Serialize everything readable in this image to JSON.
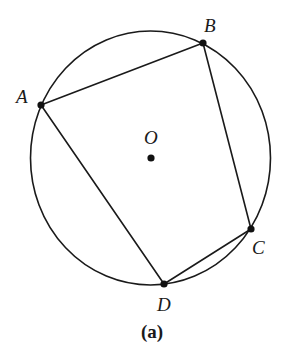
{
  "diagram": {
    "type": "cyclic-quadrilateral",
    "caption": "(a)",
    "circle": {
      "cx": 150.5,
      "cy": 158,
      "rx": 120,
      "ry": 127,
      "stroke": "#1a1a1a"
    },
    "center": {
      "label": "O",
      "x": 151,
      "y": 158,
      "label_x": 150,
      "label_y": 144
    },
    "points": [
      {
        "id": "A",
        "label": "A",
        "x": 41,
        "y": 105,
        "label_x": 22,
        "label_y": 103
      },
      {
        "id": "B",
        "label": "B",
        "x": 203,
        "y": 43,
        "label_x": 207,
        "label_y": 33
      },
      {
        "id": "C",
        "label": "C",
        "x": 251,
        "y": 229,
        "label_x": 254,
        "label_y": 253
      },
      {
        "id": "D",
        "label": "D",
        "x": 164,
        "y": 284,
        "label_x": 157,
        "label_y": 310
      }
    ],
    "edges": [
      [
        "A",
        "B"
      ],
      [
        "B",
        "C"
      ],
      [
        "C",
        "D"
      ],
      [
        "D",
        "A"
      ]
    ]
  }
}
